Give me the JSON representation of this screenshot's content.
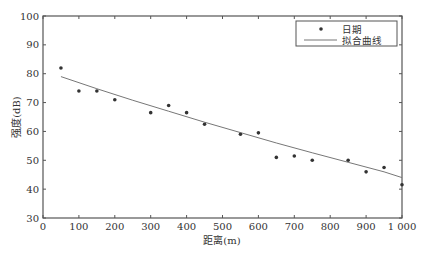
{
  "chart_data": {
    "type": "scatter",
    "title": "",
    "xlabel": "距离(m)",
    "ylabel": "强度(dB)",
    "xlim": [
      0,
      1000
    ],
    "ylim": [
      30,
      100
    ],
    "xticks": [
      0,
      100,
      200,
      300,
      400,
      500,
      600,
      700,
      800,
      900,
      1000
    ],
    "xtick_labels": [
      "0",
      "100",
      "200",
      "300",
      "400",
      "500",
      "600",
      "700",
      "800",
      "900",
      "1 000"
    ],
    "yticks": [
      30,
      40,
      50,
      60,
      70,
      80,
      90,
      100
    ],
    "ytick_labels": [
      "30",
      "40",
      "50",
      "60",
      "70",
      "80",
      "90",
      "100"
    ],
    "grid": false,
    "legend_position": "upper right",
    "series": [
      {
        "name": "日期",
        "kind": "scatter",
        "x": [
          50,
          100,
          150,
          200,
          300,
          350,
          400,
          450,
          550,
          600,
          650,
          700,
          750,
          850,
          900,
          950,
          1000
        ],
        "y": [
          82,
          74,
          74,
          71,
          66.5,
          69,
          66.5,
          62.5,
          59,
          59.5,
          51,
          51.5,
          50,
          50,
          46,
          47.5,
          41.5
        ]
      },
      {
        "name": "拟合曲线",
        "kind": "line",
        "x": [
          50,
          150,
          250,
          350,
          450,
          550,
          650,
          750,
          850,
          950,
          1000
        ],
        "y": [
          79,
          74.8,
          70.8,
          67,
          63.2,
          59.6,
          56,
          52.6,
          49.3,
          46,
          44
        ]
      }
    ]
  },
  "legend": {
    "items": [
      {
        "label": "日期",
        "symbol": "dot"
      },
      {
        "label": "拟合曲线",
        "symbol": "line"
      }
    ]
  },
  "colors": {
    "axis": "#555555",
    "marker": "#333333",
    "fit_line": "#777777"
  }
}
